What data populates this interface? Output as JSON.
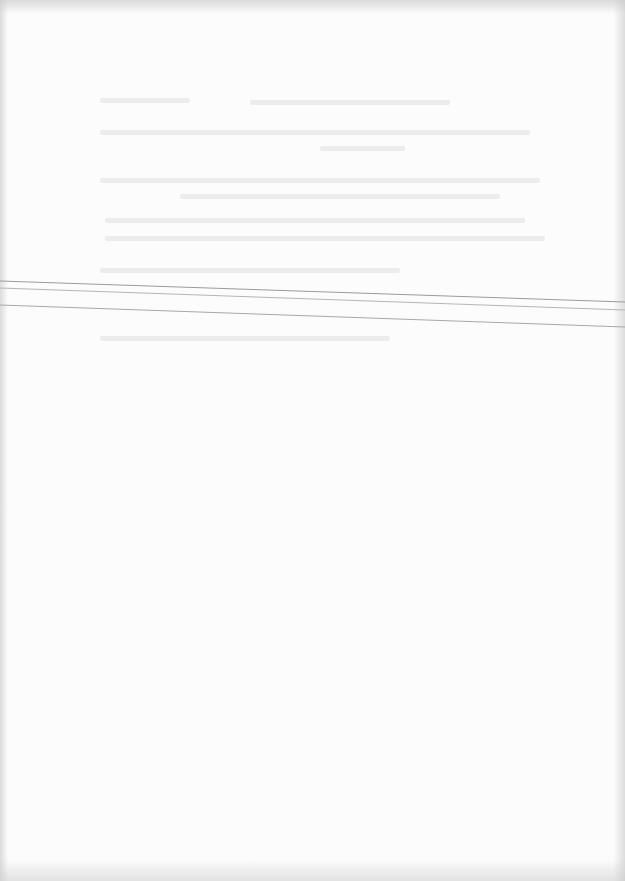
{
  "document": {
    "type": "scanned-page",
    "background_color": "#fcfcfc",
    "legible_text": [],
    "bleed_through_blocks": [
      {
        "x": 100,
        "y": 98,
        "w": 90,
        "note": "illegible"
      },
      {
        "x": 250,
        "y": 100,
        "w": 200,
        "note": "illegible"
      },
      {
        "x": 100,
        "y": 130,
        "w": 430,
        "note": "illegible"
      },
      {
        "x": 320,
        "y": 146,
        "w": 85,
        "note": "illegible"
      },
      {
        "x": 100,
        "y": 178,
        "w": 440,
        "note": "illegible"
      },
      {
        "x": 180,
        "y": 194,
        "w": 320,
        "note": "illegible"
      },
      {
        "x": 105,
        "y": 218,
        "w": 420,
        "note": "illegible"
      },
      {
        "x": 105,
        "y": 236,
        "w": 440,
        "note": "illegible"
      },
      {
        "x": 100,
        "y": 268,
        "w": 300,
        "note": "illegible"
      },
      {
        "x": 100,
        "y": 336,
        "w": 290,
        "note": "illegible"
      }
    ],
    "scan_lines": [
      {
        "x1": 0,
        "y1": 281,
        "x2": 625,
        "y2": 302,
        "color": "#9a9a9a"
      },
      {
        "x1": 0,
        "y1": 288,
        "x2": 625,
        "y2": 310,
        "color": "#b5b5b5"
      },
      {
        "x1": 0,
        "y1": 305,
        "x2": 625,
        "y2": 327,
        "color": "#a8a8a8"
      }
    ]
  }
}
